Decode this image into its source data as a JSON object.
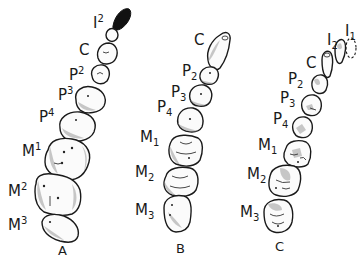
{
  "figure": {
    "panels": [
      {
        "id": "A",
        "caption": "A",
        "labels": [
          {
            "base": "I",
            "index": "2",
            "position": "sup"
          },
          {
            "base": "C",
            "index": "",
            "position": "none"
          },
          {
            "base": "P",
            "index": "2",
            "position": "sup"
          },
          {
            "base": "P",
            "index": "3",
            "position": "sup"
          },
          {
            "base": "P",
            "index": "4",
            "position": "sup"
          },
          {
            "base": "M",
            "index": "1",
            "position": "sup"
          },
          {
            "base": "M",
            "index": "2",
            "position": "sup"
          },
          {
            "base": "M",
            "index": "3",
            "position": "sup"
          }
        ]
      },
      {
        "id": "B",
        "caption": "B",
        "labels": [
          {
            "base": "C",
            "index": "",
            "position": "none"
          },
          {
            "base": "P",
            "index": "2",
            "position": "sub"
          },
          {
            "base": "P",
            "index": "3",
            "position": "sub"
          },
          {
            "base": "P",
            "index": "4",
            "position": "sub"
          },
          {
            "base": "M",
            "index": "1",
            "position": "sub"
          },
          {
            "base": "M",
            "index": "2",
            "position": "sub"
          },
          {
            "base": "M",
            "index": "3",
            "position": "sub"
          }
        ]
      },
      {
        "id": "C",
        "caption": "C",
        "labels": [
          {
            "base": "I",
            "index": "1",
            "position": "sub"
          },
          {
            "base": "I",
            "index": "2",
            "position": "sub"
          },
          {
            "base": "C",
            "index": "",
            "position": "none"
          },
          {
            "base": "P",
            "index": "2",
            "position": "sub"
          },
          {
            "base": "P",
            "index": "3",
            "position": "sub"
          },
          {
            "base": "P",
            "index": "4",
            "position": "sub"
          },
          {
            "base": "M",
            "index": "1",
            "position": "sub"
          },
          {
            "base": "M",
            "index": "2",
            "position": "sub"
          },
          {
            "base": "M",
            "index": "3",
            "position": "sub"
          }
        ]
      }
    ]
  }
}
